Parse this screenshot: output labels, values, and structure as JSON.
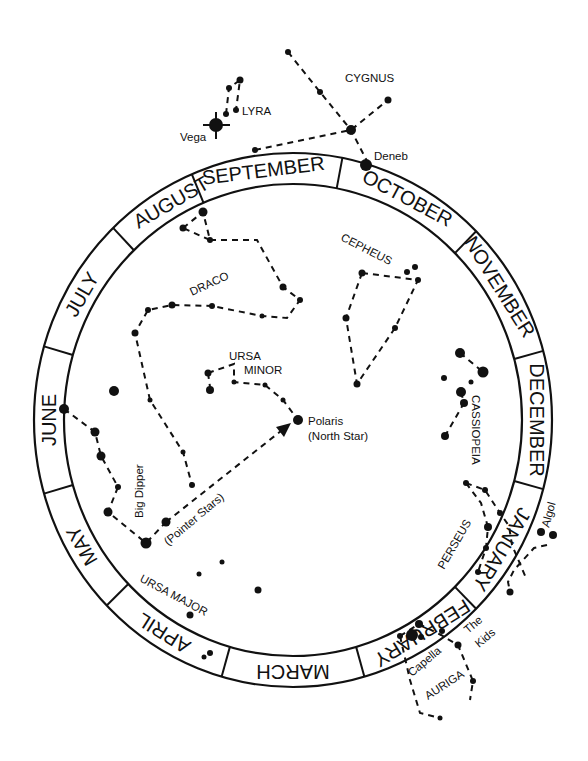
{
  "diagram": {
    "ring": {
      "center": [
        293,
        420
      ],
      "outer_radius": [
        259,
        267
      ],
      "inner_radius": [
        229,
        236
      ]
    },
    "months": [
      {
        "label": "SEPTEMBER",
        "angle": -97
      },
      {
        "label": "OCTOBER",
        "angle": -62
      },
      {
        "label": "NOVEMBER",
        "angle": -32
      },
      {
        "label": "DECEMBER",
        "angle": 0
      },
      {
        "label": "JANUARY",
        "angle": 31
      },
      {
        "label": "FEBRUARY",
        "angle": 58
      },
      {
        "label": "MARCH",
        "angle": 90
      },
      {
        "label": "APRIL",
        "angle": 122
      },
      {
        "label": "MAY",
        "angle": 150
      },
      {
        "label": "JUNE",
        "angle": 180
      },
      {
        "label": "JULY",
        "angle": 210
      },
      {
        "label": "AUGUST",
        "angle": 240
      }
    ],
    "divider_angles": [
      -113,
      -79,
      -45,
      -15,
      15,
      45,
      74,
      106,
      136,
      164,
      196,
      226
    ],
    "labels": {
      "cygnus": "CYGNUS",
      "lyra": "LYRA",
      "vega": "Vega",
      "deneb": "Deneb",
      "cepheus": "CEPHEUS",
      "draco": "DRACO",
      "ursa_minor_1": "URSA",
      "ursa_minor_2": "MINOR",
      "polaris_1": "Polaris",
      "polaris_2": "(North Star)",
      "big_dipper": "Big Dipper",
      "pointer_stars": "(Pointer Stars)",
      "ursa_major": "URSA MAJOR",
      "cassiopeia": "CASSIOPEIA",
      "perseus": "PERSEUS",
      "algol": "Algol",
      "capella": "Capella",
      "the_kids_1": "The",
      "the_kids_2": "Kids",
      "auriga": "AURIGA"
    },
    "constellations": [
      {
        "name": "Cygnus",
        "lines": [
          [
            [
              288,
              52
            ],
            [
              320,
              92
            ],
            [
              351,
              130
            ],
            [
              368,
              163
            ]
          ],
          [
            [
              255,
              150
            ],
            [
              351,
              130
            ],
            [
              388,
              100
            ]
          ]
        ]
      },
      {
        "name": "Lyra",
        "lines": [
          [
            [
              226,
              114
            ],
            [
              229,
              88
            ],
            [
              240,
              80
            ],
            [
              236,
              110
            ]
          ]
        ]
      },
      {
        "name": "Cepheus",
        "lines": [
          [
            [
              362,
              273
            ],
            [
              418,
              280
            ],
            [
              395,
              328
            ],
            [
              357,
              384
            ],
            [
              346,
              318
            ],
            [
              362,
              273
            ]
          ]
        ]
      },
      {
        "name": "Draco",
        "lines": [
          [
            [
              183,
              228
            ],
            [
              203,
              212
            ],
            [
              210,
              240
            ],
            [
              183,
              228
            ]
          ],
          [
            [
              210,
              240
            ],
            [
              257,
              240
            ],
            [
              283,
              287
            ],
            [
              300,
              300
            ],
            [
              287,
              318
            ],
            [
              262,
              316
            ],
            [
              212,
              306
            ],
            [
              172,
              305
            ],
            [
              148,
              310
            ],
            [
              135,
              333
            ],
            [
              150,
              400
            ],
            [
              183,
              452
            ],
            [
              192,
              485
            ]
          ]
        ]
      },
      {
        "name": "Ursa Minor",
        "lines": [
          [
            [
              208,
              373
            ],
            [
              234,
              364
            ],
            [
              234,
              382
            ],
            [
              265,
              385
            ],
            [
              283,
              400
            ],
            [
              298,
              420
            ]
          ],
          [
            [
              208,
              373
            ],
            [
              210,
              387
            ]
          ]
        ]
      },
      {
        "name": "Big Dipper",
        "lines": [
          [
            [
              64,
              409
            ],
            [
              95,
              432
            ],
            [
              101,
              456
            ],
            [
              118,
              487
            ],
            [
              108,
              512
            ],
            [
              146,
              543
            ],
            [
              166,
              522
            ]
          ]
        ]
      },
      {
        "name": "Pointer arrow",
        "lines": [
          [
            [
              166,
              522
            ],
            [
              286,
              427
            ]
          ]
        ]
      },
      {
        "name": "Cassiopeia",
        "lines": [
          [
            [
              460,
              353
            ],
            [
              483,
              372
            ]
          ],
          [
            [
              461,
              392
            ],
            [
              464,
              403
            ],
            [
              445,
              436
            ]
          ]
        ]
      },
      {
        "name": "Perseus",
        "lines": [
          [
            [
              466,
              483
            ],
            [
              485,
              490
            ],
            [
              500,
              513
            ],
            [
              509,
              526
            ],
            [
              512,
              545
            ],
            [
              526,
              578
            ]
          ],
          [
            [
              466,
              483
            ],
            [
              481,
              503
            ],
            [
              488,
              527
            ],
            [
              486,
              548
            ],
            [
              478,
              572
            ]
          ]
        ]
      },
      {
        "name": "Algol arm",
        "lines": [
          [
            [
              547,
              545
            ],
            [
              534,
              548
            ],
            [
              514,
              570
            ],
            [
              508,
              582
            ],
            [
              510,
              592
            ]
          ]
        ]
      },
      {
        "name": "Auriga",
        "lines": [
          [
            [
              400,
              636
            ],
            [
              419,
              624
            ],
            [
              441,
              635
            ],
            [
              458,
              645
            ],
            [
              473,
              681
            ],
            [
              470,
              700
            ]
          ],
          [
            [
              400,
              636
            ],
            [
              410,
              680
            ],
            [
              420,
              713
            ],
            [
              440,
              718
            ]
          ]
        ]
      }
    ],
    "stars": [
      [
        288,
        52,
        3
      ],
      [
        320,
        92,
        3
      ],
      [
        351,
        130,
        5
      ],
      [
        388,
        100,
        3.5
      ],
      [
        255,
        150,
        3
      ],
      [
        366,
        165,
        6
      ],
      [
        216,
        125,
        7
      ],
      [
        226,
        114,
        3
      ],
      [
        229,
        88,
        3
      ],
      [
        240,
        80,
        3.5
      ],
      [
        236,
        110,
        3
      ],
      [
        362,
        273,
        3.5
      ],
      [
        418,
        280,
        3
      ],
      [
        407,
        272,
        3
      ],
      [
        415,
        267,
        3
      ],
      [
        395,
        328,
        3
      ],
      [
        357,
        384,
        3.5
      ],
      [
        346,
        318,
        3.5
      ],
      [
        203,
        212,
        4.5
      ],
      [
        183,
        228,
        3.5
      ],
      [
        210,
        240,
        3
      ],
      [
        283,
        287,
        3.5
      ],
      [
        300,
        300,
        3
      ],
      [
        262,
        316,
        2.5
      ],
      [
        212,
        306,
        3
      ],
      [
        172,
        305,
        3.5
      ],
      [
        148,
        310,
        3
      ],
      [
        135,
        333,
        3.5
      ],
      [
        150,
        400,
        2.5
      ],
      [
        183,
        452,
        2.5
      ],
      [
        192,
        485,
        3
      ],
      [
        208,
        373,
        3.5
      ],
      [
        210,
        390,
        4
      ],
      [
        234,
        382,
        2.5
      ],
      [
        265,
        385,
        2.5
      ],
      [
        283,
        400,
        2.5
      ],
      [
        298,
        420,
        5
      ],
      [
        64,
        409,
        5
      ],
      [
        95,
        432,
        4.5
      ],
      [
        101,
        456,
        4.5
      ],
      [
        118,
        487,
        3
      ],
      [
        108,
        512,
        4.5
      ],
      [
        146,
        543,
        5.5
      ],
      [
        166,
        522,
        4.5
      ],
      [
        114,
        391,
        5
      ],
      [
        199,
        574,
        2.5
      ],
      [
        222,
        562,
        2.5
      ],
      [
        258,
        590,
        3.5
      ],
      [
        190,
        615,
        3.5
      ],
      [
        210,
        653,
        3
      ],
      [
        204,
        657,
        2.5
      ],
      [
        460,
        353,
        5
      ],
      [
        483,
        372,
        5.5
      ],
      [
        444,
        378,
        3
      ],
      [
        471,
        382,
        2.5
      ],
      [
        461,
        392,
        5
      ],
      [
        464,
        403,
        4
      ],
      [
        445,
        436,
        4
      ],
      [
        466,
        483,
        3
      ],
      [
        485,
        490,
        3
      ],
      [
        500,
        513,
        3
      ],
      [
        488,
        527,
        4
      ],
      [
        486,
        548,
        3
      ],
      [
        478,
        572,
        3
      ],
      [
        541,
        532,
        4
      ],
      [
        553,
        535,
        4
      ],
      [
        510,
        592,
        3.5
      ],
      [
        412,
        635,
        6
      ],
      [
        400,
        636,
        3
      ],
      [
        419,
        624,
        4
      ],
      [
        421,
        637,
        3
      ],
      [
        442,
        631,
        3
      ],
      [
        458,
        645,
        3.5
      ],
      [
        473,
        681,
        3
      ],
      [
        440,
        718,
        2.5
      ]
    ]
  }
}
